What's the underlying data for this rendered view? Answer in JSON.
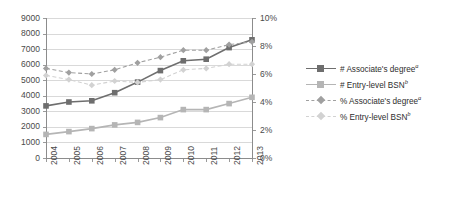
{
  "chart_data": {
    "type": "line",
    "title": "",
    "xlabel": "",
    "ylabel": "",
    "y2label": "",
    "categories": [
      "2004",
      "2005",
      "2006",
      "2007",
      "2008",
      "2009",
      "2010",
      "2011",
      "2012",
      "2013"
    ],
    "ylim": [
      0,
      9000
    ],
    "yticks": [
      "0",
      "1000",
      "2000",
      "3000",
      "4000",
      "5000",
      "6000",
      "7000",
      "8000",
      "9000"
    ],
    "y2lim": [
      0,
      10
    ],
    "y2ticks": [
      "0%",
      "2%",
      "4%",
      "6%",
      "8%",
      "10%"
    ],
    "grid": true,
    "legend_position": "right",
    "series": [
      {
        "name": "# Associate's degree",
        "name_sup": "a",
        "axis": "left",
        "style": "solid",
        "marker": "square",
        "color": "#6e6e6e",
        "values": [
          3350,
          3600,
          3680,
          4200,
          4880,
          5620,
          6250,
          6350,
          7100,
          7600
        ]
      },
      {
        "name": "# Entry-level BSN",
        "name_sup": "b",
        "axis": "left",
        "style": "solid",
        "marker": "square",
        "color": "#b5b5b5",
        "values": [
          1520,
          1700,
          1890,
          2130,
          2290,
          2600,
          3110,
          3110,
          3500,
          3900
        ]
      },
      {
        "name": "% Associate's degree",
        "name_sup": "a",
        "axis": "right",
        "style": "dashed",
        "marker": "diamond",
        "color": "#a0a0a0",
        "values": [
          6.4,
          6.1,
          6.0,
          6.3,
          6.8,
          7.2,
          7.7,
          7.7,
          8.1,
          8.3
        ]
      },
      {
        "name": "% Entry-level BSN",
        "name_sup": "b",
        "axis": "right",
        "style": "dashed",
        "marker": "diamond",
        "color": "#d2d2d2",
        "values": [
          5.9,
          5.6,
          5.2,
          5.5,
          5.4,
          5.6,
          6.3,
          6.4,
          6.7,
          6.7
        ]
      }
    ]
  },
  "legend": {
    "items": [
      {
        "label": "# Associate's degree",
        "sup": "a"
      },
      {
        "label": "# Entry-level BSN",
        "sup": "b"
      },
      {
        "label": "% Associate's degree",
        "sup": "a"
      },
      {
        "label": "% Entry-level BSN",
        "sup": "b"
      }
    ]
  }
}
